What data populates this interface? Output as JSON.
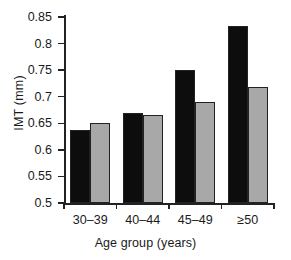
{
  "chart_data": {
    "type": "bar",
    "title": "",
    "subtitle": "",
    "xlabel": "Age group (years)",
    "ylabel": "IMT (mm)",
    "categories": [
      "30–39",
      "40–44",
      "45–49",
      "≥50"
    ],
    "series": [
      {
        "name": "series-1",
        "color": "#0d0d0d",
        "values": [
          0.638,
          0.67,
          0.751,
          0.833
        ]
      },
      {
        "name": "series-2",
        "color": "#a8a8a8",
        "values": [
          0.65,
          0.665,
          0.691,
          0.718
        ]
      }
    ],
    "ylim": [
      0.5,
      0.85
    ],
    "ytick_values": [
      0.85,
      0.8,
      0.75,
      0.7,
      0.65,
      0.6,
      0.55,
      0.5
    ],
    "ytick_labels": [
      "0.85",
      "0.8",
      "0.75",
      "0.7",
      "0.65",
      "0.6",
      "0.55",
      "0.5"
    ],
    "ystep": 0.05,
    "grid": false,
    "legend": null,
    "legend_position": "none",
    "annotations": []
  },
  "axes": {
    "y_title": "IMT (mm)",
    "x_title": "Age group (years)"
  }
}
